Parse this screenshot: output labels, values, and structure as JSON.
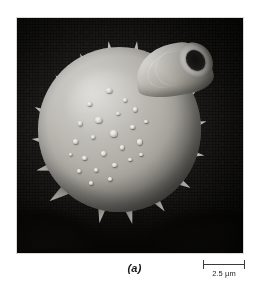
{
  "figure": {
    "panel_label": "(a)",
    "kind": "scanning-electron-micrograph",
    "background_color": "#0a0908",
    "specimen_color": "#b0aea7",
    "plate": {
      "left": 17,
      "top": 18,
      "width": 226,
      "height": 235
    }
  },
  "scale_bar": {
    "label": "2.5 µm",
    "value": 2.5,
    "unit": "µm",
    "bar_length_px": 42,
    "tick_color": "#3a3a3a"
  },
  "specimen": {
    "body": {
      "shape": "sphere",
      "cx_pct": 45.5,
      "cy_pct": 47.5,
      "r_pct": 36
    },
    "warts": [
      {
        "x": 30.0,
        "y": 33.0,
        "w": 3.2,
        "h": 2.9
      },
      {
        "x": 41.5,
        "y": 24.5,
        "w": 3.6,
        "h": 3.2
      },
      {
        "x": 52.0,
        "y": 31.0,
        "w": 2.6,
        "h": 2.4
      },
      {
        "x": 24.0,
        "y": 45.0,
        "w": 3.0,
        "h": 2.8
      },
      {
        "x": 35.0,
        "y": 42.5,
        "w": 4.0,
        "h": 3.6
      },
      {
        "x": 47.5,
        "y": 39.0,
        "w": 2.4,
        "h": 2.2
      },
      {
        "x": 58.0,
        "y": 36.5,
        "w": 2.8,
        "h": 2.6
      },
      {
        "x": 21.0,
        "y": 56.0,
        "w": 3.4,
        "h": 3.0
      },
      {
        "x": 32.0,
        "y": 53.5,
        "w": 2.5,
        "h": 2.4
      },
      {
        "x": 44.0,
        "y": 50.5,
        "w": 4.4,
        "h": 4.0
      },
      {
        "x": 56.5,
        "y": 47.0,
        "w": 3.0,
        "h": 2.8
      },
      {
        "x": 65.0,
        "y": 44.0,
        "w": 2.2,
        "h": 2.1
      },
      {
        "x": 27.0,
        "y": 66.0,
        "w": 2.6,
        "h": 2.5
      },
      {
        "x": 38.5,
        "y": 63.0,
        "w": 3.0,
        "h": 2.8
      },
      {
        "x": 50.0,
        "y": 59.5,
        "w": 2.8,
        "h": 2.6
      },
      {
        "x": 60.5,
        "y": 56.0,
        "w": 3.4,
        "h": 3.1
      },
      {
        "x": 23.5,
        "y": 74.0,
        "w": 2.8,
        "h": 2.6
      },
      {
        "x": 34.0,
        "y": 73.5,
        "w": 2.4,
        "h": 2.3
      },
      {
        "x": 45.0,
        "y": 70.0,
        "w": 3.0,
        "h": 2.8
      },
      {
        "x": 55.0,
        "y": 67.0,
        "w": 2.3,
        "h": 2.2
      },
      {
        "x": 31.0,
        "y": 81.5,
        "w": 2.6,
        "h": 2.4
      },
      {
        "x": 43.0,
        "y": 79.0,
        "w": 2.2,
        "h": 2.1
      },
      {
        "x": 62.0,
        "y": 64.0,
        "w": 2.0,
        "h": 1.9
      },
      {
        "x": 18.5,
        "y": 64.0,
        "w": 2.2,
        "h": 2.1
      }
    ],
    "spines": [
      {
        "x": 12.0,
        "y": 40.0,
        "w": 6.0,
        "h": 9.0,
        "rot": -62
      },
      {
        "x": 10.5,
        "y": 52.0,
        "w": 5.5,
        "h": 8.0,
        "rot": -84
      },
      {
        "x": 13.0,
        "y": 64.0,
        "w": 5.5,
        "h": 8.5,
        "rot": -104
      },
      {
        "x": 18.0,
        "y": 75.5,
        "w": 6.0,
        "h": 9.0,
        "rot": -126
      },
      {
        "x": 20.0,
        "y": 28.0,
        "w": 5.5,
        "h": 9.5,
        "rot": -36
      },
      {
        "x": 29.5,
        "y": 19.0,
        "w": 5.0,
        "h": 9.0,
        "rot": -22
      },
      {
        "x": 41.0,
        "y": 14.5,
        "w": 5.5,
        "h": 9.5,
        "rot": -8
      },
      {
        "x": 52.5,
        "y": 14.0,
        "w": 5.0,
        "h": 8.5,
        "rot": 6
      },
      {
        "x": 76.0,
        "y": 33.0,
        "w": 5.5,
        "h": 9.0,
        "rot": 52
      },
      {
        "x": 79.5,
        "y": 45.0,
        "w": 5.5,
        "h": 8.5,
        "rot": 74
      },
      {
        "x": 78.5,
        "y": 58.0,
        "w": 5.5,
        "h": 9.0,
        "rot": 98
      },
      {
        "x": 73.0,
        "y": 70.0,
        "w": 5.5,
        "h": 8.5,
        "rot": 120
      },
      {
        "x": 63.0,
        "y": 79.0,
        "w": 5.0,
        "h": 8.0,
        "rot": 142
      },
      {
        "x": 50.0,
        "y": 84.0,
        "w": 5.0,
        "h": 8.0,
        "rot": 166
      },
      {
        "x": 37.0,
        "y": 83.5,
        "w": 5.0,
        "h": 8.0,
        "rot": 190
      }
    ],
    "projection": {
      "name": "germination-tube",
      "position": "top-right",
      "has_open_aperture": true
    }
  }
}
